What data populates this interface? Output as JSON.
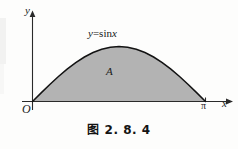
{
  "figure": {
    "caption": "图 2.8.4",
    "caption_cjk": "图",
    "caption_number": "2. 8. 4"
  },
  "axes": {
    "y_label": "y",
    "x_label": "x",
    "origin_label": "O",
    "x_tick_label": "π"
  },
  "annotations": {
    "curve_label_lhs": "y",
    "curve_label_eq": "=",
    "curve_label_rhs": "sin",
    "curve_label_arg": "x",
    "curve_label_full": "y=sinx",
    "region_label": "A"
  },
  "colors": {
    "background": "#fdfdfc",
    "ink": "#1b1b1b",
    "region_fill": "#b3b3b3",
    "curve_stroke": "#131313",
    "axis_stroke": "#2a2a2a"
  },
  "chart_data": {
    "type": "area",
    "title": "",
    "xlabel": "x",
    "ylabel": "y",
    "function": "y = sin x",
    "shaded_region_label": "A",
    "xlim": [
      0,
      3.14159
    ],
    "ylim": [
      0,
      1
    ],
    "x_ticks": [
      0,
      3.14159
    ],
    "x_tick_labels": [
      "O",
      "π"
    ],
    "y_ticks": [],
    "y_tick_labels": [],
    "grid": false,
    "legend": "none",
    "x": [
      0,
      0.15708,
      0.31416,
      0.47124,
      0.62832,
      0.7854,
      0.94248,
      1.09956,
      1.25664,
      1.41372,
      1.5708,
      1.72788,
      1.88496,
      2.04204,
      2.19911,
      2.35619,
      2.51327,
      2.67035,
      2.82743,
      2.98451,
      3.14159
    ],
    "y": [
      0,
      0.15643,
      0.30902,
      0.45399,
      0.58779,
      0.70711,
      0.80902,
      0.89101,
      0.95106,
      0.98769,
      1.0,
      0.98769,
      0.95106,
      0.89101,
      0.80902,
      0.70711,
      0.58779,
      0.45399,
      0.30902,
      0.15643,
      0
    ]
  }
}
